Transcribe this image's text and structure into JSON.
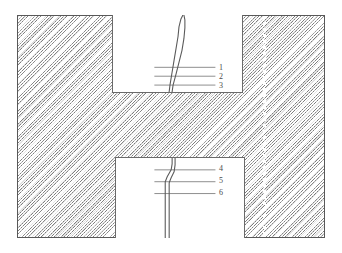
{
  "figure": {
    "kind": "technical-schematic",
    "colors": {
      "hatch_line": "#787878",
      "frame_border": "#585858",
      "inset_border": "#6a6a6a",
      "trace": "#5a5a5a",
      "marker_line": "#707070",
      "label_text": "#4a4a4a",
      "dotted_line": "#ffffff",
      "background": "#ffffff"
    },
    "frame": {
      "x": 17,
      "y": 15,
      "width": 308,
      "height": 223,
      "hatch_angle_deg": 135,
      "hatch_spacing_px": 2.3
    },
    "dotted_centerline": {
      "x": 263,
      "style": "dotted",
      "color": "#ffffff",
      "orientation": "vertical"
    },
    "insets": [
      {
        "id": "inset-top",
        "x": 112,
        "y": 15,
        "width": 131,
        "height": 78,
        "attached_edge": "top",
        "traces": [
          {
            "id": "trace-top-a",
            "points": "71,0 69,4 67,12 66,22 64,34 62,46 60,58 58,70 57,78"
          },
          {
            "id": "trace-top-b",
            "points": "72,0 73,5 73,13 72,24 70,36 67,48 64,60 61,71 60,78"
          }
        ],
        "markers": [
          {
            "label": "1",
            "y": 53,
            "x_start": 42,
            "x_end": 104,
            "label_x": 107,
            "label_y": 49
          },
          {
            "label": "2",
            "y": 62,
            "x_start": 42,
            "x_end": 104,
            "label_x": 107,
            "label_y": 58
          },
          {
            "label": "3",
            "y": 71,
            "x_start": 42,
            "x_end": 104,
            "label_x": 107,
            "label_y": 67
          }
        ]
      },
      {
        "id": "inset-bottom",
        "x": 115,
        "y": 157,
        "width": 130,
        "height": 81,
        "attached_edge": "bottom",
        "traces": [
          {
            "id": "trace-bottom-a",
            "points": "57,0 57,6 56,12 52,19 50,24 50,32 50,46 50,60 50,72 50,81"
          },
          {
            "id": "trace-bottom-b",
            "points": "60,0 60,7 59,14 56,20 54,25 54,33 54,47 54,61 54,73 54,81"
          }
        ],
        "markers": [
          {
            "label": "4",
            "y": 12,
            "x_start": 39,
            "x_end": 101,
            "label_x": 104,
            "label_y": 8
          },
          {
            "label": "5",
            "y": 24,
            "x_start": 39,
            "x_end": 101,
            "label_x": 104,
            "label_y": 20
          },
          {
            "label": "6",
            "y": 36,
            "x_start": 39,
            "x_end": 101,
            "label_x": 104,
            "label_y": 32
          }
        ]
      }
    ]
  }
}
